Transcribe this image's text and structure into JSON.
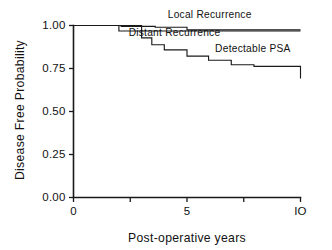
{
  "chart_data": {
    "type": "line",
    "title": "",
    "xlabel": "Post-operative years",
    "ylabel": "Disease Free Probability",
    "xlim": [
      0,
      10
    ],
    "ylim": [
      0,
      1
    ],
    "grid": false,
    "legend_position": "inline-right",
    "x_ticks": [
      0,
      2.5,
      5,
      7.5,
      10
    ],
    "x_tick_labels": [
      "0",
      "",
      "5",
      "",
      "IO"
    ],
    "y_ticks": [
      0,
      0.25,
      0.5,
      0.75,
      1
    ],
    "y_tick_labels": [
      "0.00",
      "0.25",
      "0.50",
      "0.75",
      "1.00"
    ],
    "step_type": "post",
    "series": [
      {
        "name": "Local Recurrence",
        "label": "Local Recurrence",
        "label_x": 6.0,
        "label_y": 1.045,
        "x": [
          0,
          1.3,
          2.1,
          3.6,
          5.0,
          10
        ],
        "values": [
          1.0,
          1.0,
          0.995,
          0.99,
          0.975,
          0.975
        ]
      },
      {
        "name": "Distant Recurrence",
        "label": "Distant Recurrence",
        "label_x": 4.45,
        "label_y": 0.938,
        "x": [
          0,
          1.25,
          2.0,
          3.5,
          10
        ],
        "values": [
          1.0,
          1.0,
          0.968,
          0.968,
          0.968
        ]
      },
      {
        "name": "Detectable PSA",
        "label": "Detectable PSA",
        "label_x": 7.9,
        "label_y": 0.845,
        "x": [
          0,
          1.95,
          3.0,
          3.45,
          4.0,
          5.0,
          5.95,
          6.95,
          7.95,
          10
        ],
        "values": [
          1.0,
          1.0,
          0.928,
          0.888,
          0.858,
          0.822,
          0.798,
          0.772,
          0.762,
          0.692
        ]
      }
    ]
  }
}
